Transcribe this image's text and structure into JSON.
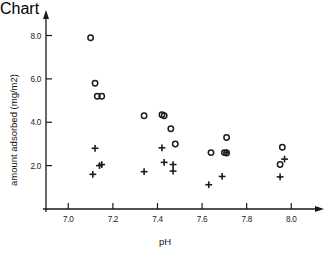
{
  "chart_data": {
    "type": "scatter",
    "title": "",
    "xlabel": "pH",
    "ylabel": "amount adsorbed (mg/m2)",
    "xlim": [
      6.9,
      8.12
    ],
    "ylim": [
      0.0,
      8.9
    ],
    "xticks": [
      7.0,
      7.2,
      7.4,
      7.6,
      7.8,
      8.0
    ],
    "xticklabels": [
      "7.0",
      "7.2",
      "7.4",
      "7.6",
      "7.8",
      "8.0"
    ],
    "yticks": [
      2.0,
      4.0,
      6.0,
      8.0
    ],
    "yticklabels": [
      "2.0",
      "4.0",
      "6.0",
      "8.0"
    ],
    "grid": false,
    "legend": false,
    "legend_position": "none",
    "axis_style": "arrow-spines-left-bottom",
    "series": [
      {
        "name": "open circle",
        "marker": "circle-open",
        "color": "#1c1c1c",
        "points": [
          {
            "x": 7.1,
            "y": 7.9
          },
          {
            "x": 7.12,
            "y": 5.8
          },
          {
            "x": 7.13,
            "y": 5.2
          },
          {
            "x": 7.15,
            "y": 5.2
          },
          {
            "x": 7.34,
            "y": 4.3
          },
          {
            "x": 7.42,
            "y": 4.35
          },
          {
            "x": 7.43,
            "y": 4.3
          },
          {
            "x": 7.46,
            "y": 3.7
          },
          {
            "x": 7.48,
            "y": 3.0
          },
          {
            "x": 7.64,
            "y": 2.6
          },
          {
            "x": 7.71,
            "y": 3.3
          },
          {
            "x": 7.7,
            "y": 2.6
          },
          {
            "x": 7.71,
            "y": 2.58
          },
          {
            "x": 7.96,
            "y": 2.85
          },
          {
            "x": 7.95,
            "y": 2.05
          }
        ]
      },
      {
        "name": "plus",
        "marker": "plus",
        "color": "#1c1c1c",
        "points": [
          {
            "x": 7.12,
            "y": 2.8
          },
          {
            "x": 7.14,
            "y": 2.0
          },
          {
            "x": 7.15,
            "y": 2.05
          },
          {
            "x": 7.11,
            "y": 1.6
          },
          {
            "x": 7.34,
            "y": 1.72
          },
          {
            "x": 7.42,
            "y": 2.82
          },
          {
            "x": 7.43,
            "y": 2.15
          },
          {
            "x": 7.47,
            "y": 2.05
          },
          {
            "x": 7.47,
            "y": 1.75
          },
          {
            "x": 7.63,
            "y": 1.12
          },
          {
            "x": 7.69,
            "y": 1.5
          },
          {
            "x": 7.71,
            "y": 2.6
          },
          {
            "x": 7.97,
            "y": 2.3
          },
          {
            "x": 7.95,
            "y": 1.48
          }
        ]
      }
    ]
  },
  "figure": {
    "x_axis_title": "pH",
    "y_axis_title": "amount adsorbed (mg/m2)"
  }
}
